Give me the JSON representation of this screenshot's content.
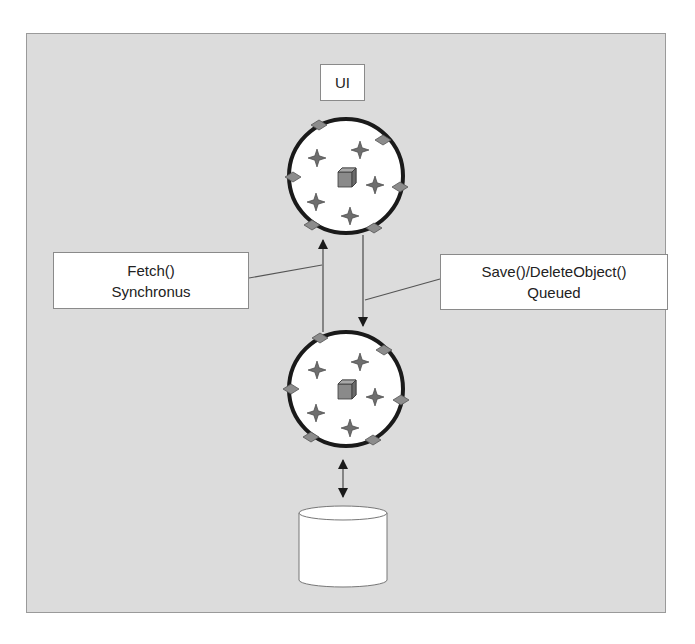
{
  "diagram": {
    "ui_label": "UI",
    "fetch_label": {
      "line1": "Fetch()",
      "line2": "Synchronus"
    },
    "save_label": {
      "line1": "Save()/DeleteObject()",
      "line2": "Queued"
    },
    "nodes": [
      {
        "id": "ui",
        "type": "label",
        "text": "UI"
      },
      {
        "id": "client-object-context",
        "type": "circle-with-objects"
      },
      {
        "id": "server-object-context",
        "type": "circle-with-objects"
      },
      {
        "id": "database",
        "type": "cylinder"
      }
    ],
    "edges": [
      {
        "from": "server-object-context",
        "to": "client-object-context",
        "label": "Fetch() Synchronus",
        "direction": "up"
      },
      {
        "from": "client-object-context",
        "to": "server-object-context",
        "label": "Save()/DeleteObject() Queued",
        "direction": "down"
      },
      {
        "from": "server-object-context",
        "to": "database",
        "direction": "both"
      }
    ],
    "colors": {
      "background": "#dcdcdc",
      "frame_border": "#9a9a9a",
      "circle_stroke": "#1a1a1a",
      "diamond_fill": "#8c8c8c",
      "star_fill": "#6e6e6e",
      "cube_fill": "#8a8a8a",
      "box_fill": "#ffffff"
    }
  }
}
